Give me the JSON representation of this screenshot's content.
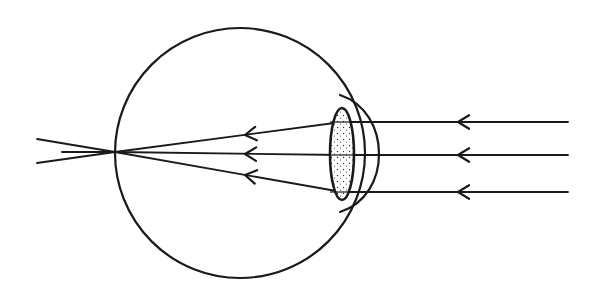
{
  "title": "Eye diagram: parallel rays focusing on the retina",
  "colors": {
    "ink": "#1a1a1a",
    "background": "#ffffff",
    "lens_fill": "#ffffff",
    "stipple": "#333333"
  },
  "eyeball": {
    "cx": 240,
    "cy": 153,
    "r": 125
  },
  "lens": {
    "cx": 342,
    "cy": 154,
    "rx": 12,
    "ry": 46,
    "fill_pattern": "stippled"
  },
  "cornea": {
    "path": "M 340 95 C 392 112, 392 196, 340 212"
  },
  "focal_point": {
    "x": 115,
    "y": 152
  },
  "rays": [
    {
      "name": "upper",
      "incoming": {
        "x1": 568,
        "y1": 122,
        "x2": 342,
        "y2": 122
      },
      "refracted": {
        "x1": 342,
        "y1": 122,
        "x2": 115,
        "y2": 152
      },
      "beyond": {
        "x1": 115,
        "y1": 152,
        "x2": 37,
        "y2": 163
      },
      "arrows": [
        {
          "x": 458,
          "y": 122
        },
        {
          "x": 245,
          "y": 135
        }
      ]
    },
    {
      "name": "middle",
      "incoming": {
        "x1": 568,
        "y1": 155,
        "x2": 342,
        "y2": 155
      },
      "refracted": {
        "x1": 342,
        "y1": 155,
        "x2": 115,
        "y2": 152
      },
      "beyond": {
        "x1": 115,
        "y1": 152,
        "x2": 62,
        "y2": 152
      },
      "arrows": [
        {
          "x": 458,
          "y": 155
        },
        {
          "x": 245,
          "y": 154
        }
      ]
    },
    {
      "name": "lower",
      "incoming": {
        "x1": 568,
        "y1": 192,
        "x2": 342,
        "y2": 192
      },
      "refracted": {
        "x1": 342,
        "y1": 192,
        "x2": 115,
        "y2": 152
      },
      "beyond": {
        "x1": 115,
        "y1": 152,
        "x2": 37,
        "y2": 139
      },
      "arrows": [
        {
          "x": 458,
          "y": 192
        },
        {
          "x": 245,
          "y": 175
        }
      ]
    }
  ]
}
